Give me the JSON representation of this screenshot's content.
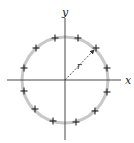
{
  "diagram": {
    "type": "ring-of-charges",
    "axes": {
      "x_label": "x",
      "y_label": "y"
    },
    "radius_label": "r",
    "charge_symbol": "+",
    "charge_count": 12,
    "colors": {
      "ring": "#c8c8c8",
      "axis": "#333333",
      "charge": "#222222",
      "arrow": "#333333"
    },
    "geometry": {
      "center": [
        65,
        80
      ],
      "ring_radius": 43,
      "charges": [
        [
          55,
          38
        ],
        [
          78,
          38
        ],
        [
          96,
          48
        ],
        [
          107,
          68
        ],
        [
          107,
          92
        ],
        [
          95,
          111
        ],
        [
          76,
          122
        ],
        [
          53,
          121
        ],
        [
          35,
          109
        ],
        [
          24,
          91
        ],
        [
          24,
          68
        ],
        [
          36,
          48
        ]
      ],
      "arrow_end": [
        96,
        48
      ]
    }
  }
}
